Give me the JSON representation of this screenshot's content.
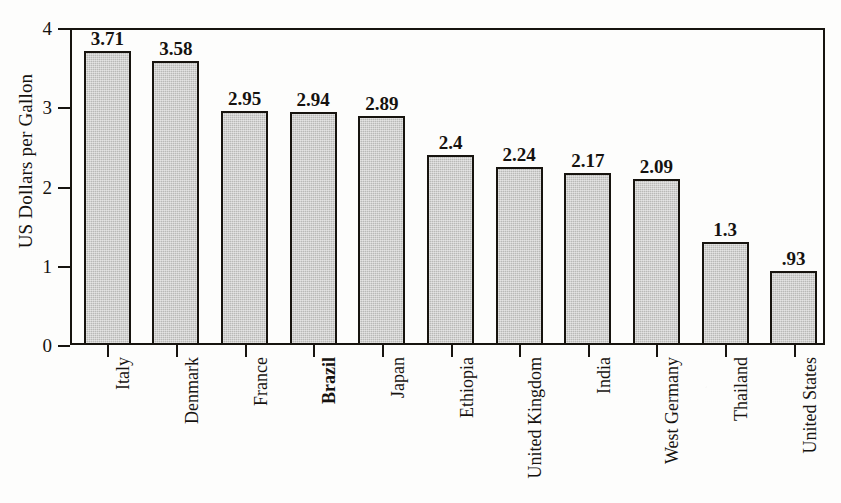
{
  "chart_data": {
    "type": "bar",
    "title": "",
    "xlabel": "",
    "ylabel": "US Dollars per Gallon",
    "categories": [
      "Italy",
      "Denmark",
      "France",
      "Brazil",
      "Japan",
      "Ethiopia",
      "United Kingdom",
      "India",
      "West Germany",
      "Thailand",
      "United States"
    ],
    "values": [
      3.71,
      3.58,
      2.95,
      2.94,
      2.89,
      2.4,
      2.24,
      2.17,
      2.09,
      1.3,
      0.93
    ],
    "value_labels": [
      "3.71",
      "3.58",
      "2.95",
      "2.94",
      "2.89",
      "2.4",
      "2.24",
      "2.17",
      "2.09",
      "1.3",
      ".93"
    ],
    "ylim": [
      0,
      4
    ],
    "ytick_values": [
      0,
      1,
      2,
      3,
      4
    ],
    "ytick_labels": [
      "0",
      "1",
      "2",
      "3",
      "4"
    ],
    "grid": false,
    "legend": "none",
    "bar_fill_color": "#b9b9b7",
    "bar_edge_color": "#17140f",
    "axis_color": "#17140f",
    "background_color": "#fdfdfc",
    "text_color": "#15120f",
    "category_label_rotation": 90,
    "emphasized_categories": [
      "Brazil"
    ]
  }
}
